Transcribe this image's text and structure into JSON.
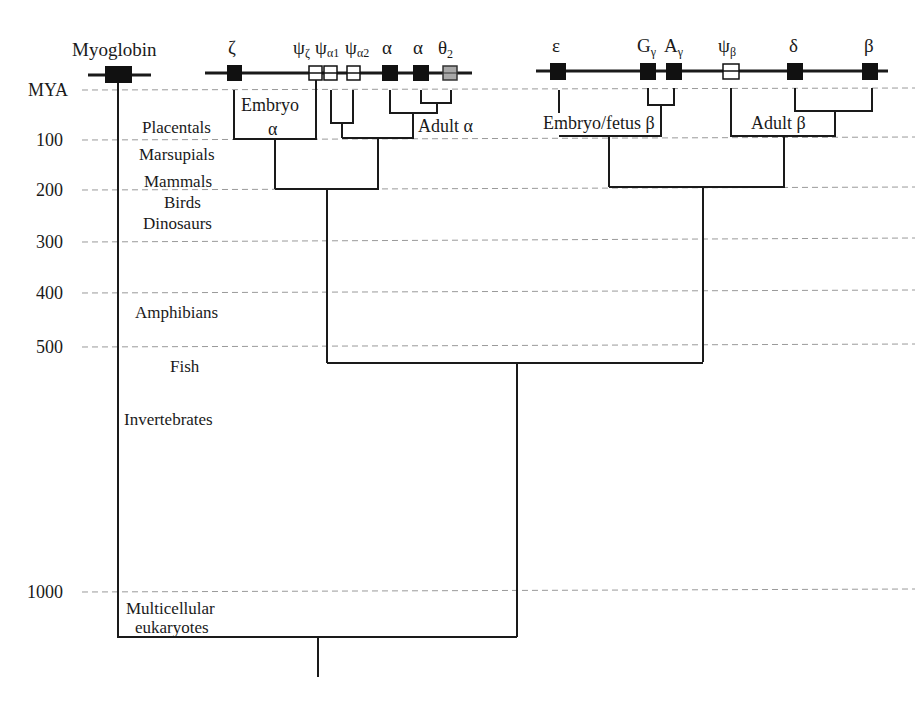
{
  "figure": {
    "type": "gene-family-phylogeny",
    "axis": {
      "unit_label": "MYA",
      "ticks": [
        {
          "label": "MYA",
          "value": 0,
          "y": 90
        },
        {
          "label": "100",
          "value": 100,
          "y": 140
        },
        {
          "label": "200",
          "value": 200,
          "y": 190
        },
        {
          "label": "300",
          "value": 300,
          "y": 242
        },
        {
          "label": "400",
          "value": 400,
          "y": 293
        },
        {
          "label": "500",
          "value": 500,
          "y": 347
        },
        {
          "label": "1000",
          "value": 1000,
          "y": 591
        }
      ]
    },
    "taxa": [
      {
        "label": "Placentals"
      },
      {
        "label": "Marsupials"
      },
      {
        "label": "Mammals"
      },
      {
        "label": "Birds"
      },
      {
        "label": "Dinosaurs"
      },
      {
        "label": "Amphibians"
      },
      {
        "label": "Fish"
      },
      {
        "label": "Invertebrates"
      },
      {
        "label": "Multicellular"
      },
      {
        "label": "eukaryotes"
      }
    ],
    "genes": {
      "myoglobin": {
        "label": "Myoglobin",
        "type": "functional"
      },
      "alpha_cluster": [
        {
          "label": "ζ",
          "sub": "",
          "type": "functional"
        },
        {
          "label": "ψ",
          "sub": "ζ",
          "type": "pseudogene"
        },
        {
          "label": "ψ",
          "sub": "α1",
          "type": "pseudogene"
        },
        {
          "label": "ψ",
          "sub": "α2",
          "type": "pseudogene"
        },
        {
          "label": "α",
          "sub": "",
          "type": "functional"
        },
        {
          "label": "α",
          "sub": "",
          "type": "functional"
        },
        {
          "label": "θ",
          "sub": "2",
          "type": "uncertain"
        }
      ],
      "beta_cluster": [
        {
          "label": "ε",
          "sub": "",
          "type": "functional"
        },
        {
          "label": "G",
          "sub": "γ",
          "type": "functional"
        },
        {
          "label": "A",
          "sub": "γ",
          "type": "functional"
        },
        {
          "label": "ψ",
          "sub": "β",
          "type": "pseudogene"
        },
        {
          "label": "δ",
          "sub": "",
          "type": "functional"
        },
        {
          "label": "β",
          "sub": "",
          "type": "functional"
        }
      ]
    },
    "groups": {
      "embryo_alpha_line1": "Embryo",
      "embryo_alpha_line2": "α",
      "adult_alpha": "Adult α",
      "embryo_fetus_beta": "Embryo/fetus β",
      "adult_beta": "Adult β"
    },
    "colors": {
      "functional_gene": "#111111",
      "pseudogene": "#ffffff",
      "uncertain_gene": "#a8a8a8",
      "line": "#1a1a1a",
      "grid": "#9a9a9a"
    }
  }
}
